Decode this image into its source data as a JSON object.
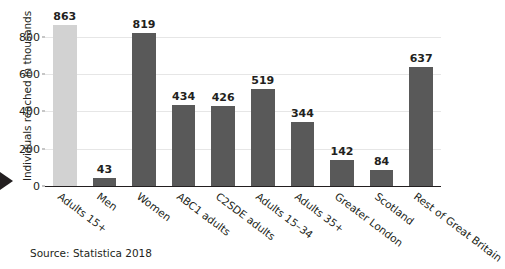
{
  "chart_data": {
    "type": "bar",
    "title": "",
    "subtitle": "",
    "xlabel": "",
    "ylabel": "Individuals reached in thousands",
    "categories": [
      "Adults 15+",
      "Men",
      "Women",
      "ABC1 adults",
      "C2SDE adults",
      "Adults 15–34",
      "Adults 35+",
      "Greater London",
      "Scotland",
      "Rest of Great Britain"
    ],
    "values": [
      863,
      43,
      819,
      434,
      426,
      519,
      344,
      142,
      84,
      637
    ],
    "ylim": [
      0,
      900
    ],
    "yticks": [
      0,
      200,
      400,
      600,
      800
    ],
    "ytick_labels": [
      "0",
      "200",
      "400",
      "600",
      "800"
    ],
    "grid": "horizontal",
    "legend": "none",
    "bar_colors": {
      "default": "#595959",
      "highlight": "#d2d2d2"
    },
    "highlight_index": 0,
    "data_labels_shown": true,
    "source_note": "Source: Statistica 2018"
  },
  "marker": {
    "name": "pointer-triangle",
    "color": "#231f20"
  }
}
